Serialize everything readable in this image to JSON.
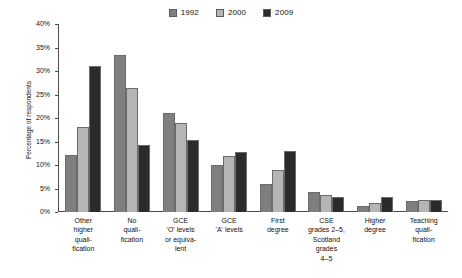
{
  "chart_data": {
    "type": "bar",
    "title": "",
    "xlabel": "",
    "ylabel": "Percentage of respondents",
    "ylim": [
      0,
      40
    ],
    "ytick_labels": [
      "0%",
      "5%",
      "10%",
      "15%",
      "20%",
      "25%",
      "30%",
      "35%",
      "40%"
    ],
    "ytick_values": [
      0,
      5,
      10,
      15,
      20,
      25,
      30,
      35,
      40
    ],
    "grid": false,
    "legend_position": "top-center",
    "categories": [
      "Other higher quali-fication",
      "No quali-fication",
      "GCE 'O' levels or equiva-lent",
      "GCE 'A' levels",
      "First degree",
      "CSE grades 2–5, Scotland grades 4–5",
      "Higher degree",
      "Teaching quali-fication"
    ],
    "category_lines": [
      [
        "Other",
        "higher",
        "quali-",
        "fication"
      ],
      [
        "No",
        "quali-",
        "fication"
      ],
      [
        "GCE",
        "'O' levels",
        "or equiva-",
        "lent"
      ],
      [
        "GCE",
        "'A' levels"
      ],
      [
        "First",
        "degree"
      ],
      [
        "CSE",
        "grades 2–5,",
        "Scotland",
        "grades",
        "4–5"
      ],
      [
        "Higher",
        "degree"
      ],
      [
        "Teaching",
        "quali-",
        "fication"
      ]
    ],
    "series": [
      {
        "name": "1992",
        "color": "#7f7f7f",
        "values": [
          12.2,
          33.5,
          21.0,
          10.0,
          6.0,
          4.2,
          1.2,
          2.4
        ]
      },
      {
        "name": "2000",
        "color": "#b5b5b5",
        "values": [
          18.0,
          26.3,
          19.0,
          12.0,
          9.0,
          3.6,
          2.0,
          2.6
        ]
      },
      {
        "name": "2009",
        "color": "#2b2b2b",
        "values": [
          31.0,
          14.2,
          15.3,
          12.8,
          13.0,
          3.1,
          3.1,
          2.5
        ]
      }
    ]
  }
}
